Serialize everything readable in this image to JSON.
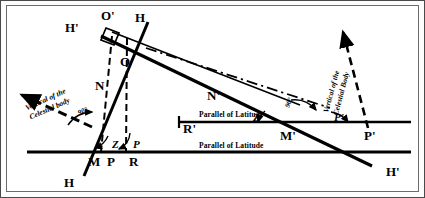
{
  "figure": {
    "type": "astronomical-navigation-diagram",
    "background_color": "#ffffff",
    "line_color": "#000000",
    "frame_color": "#4a4a4a"
  },
  "labels": {
    "h_top_left": "H'",
    "o_prime_top": "O'",
    "h_top_right": "H",
    "o_inner": "O",
    "n_left": "N",
    "n_prime_right": "N'",
    "m_left": "M",
    "p_left": "P",
    "r_left": "R",
    "r_prime": "R'",
    "z_left": "Z",
    "p_angle_left": "P",
    "h_bottom_left": "H",
    "z_prime_right": "Z'",
    "p_prime_angle_right": "P'",
    "m_prime_right": "M'",
    "p_prime_right": "P'",
    "h_prime_bottom_right": "H'"
  },
  "angles": {
    "left_ninety": "90°",
    "right_ninety": "90°"
  },
  "annotations": {
    "vertical_left_line1": "Vertical of the",
    "vertical_left_line2": "Celestial body",
    "vertical_right_line1": "Vertical of the",
    "vertical_right_line2": "Celestial Body",
    "parallel_of_latitude_upper": "Parallel of Latitude",
    "parallel_of_latitude_lower": "Parallel of Latitude"
  }
}
